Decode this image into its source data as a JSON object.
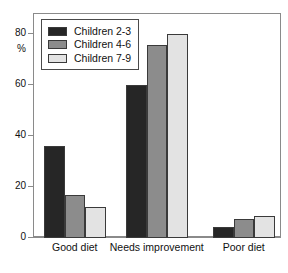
{
  "chart_data": {
    "type": "bar",
    "title": "",
    "subtitle": "",
    "xlabel": "",
    "ylabel": "%",
    "ylim": [
      0,
      88
    ],
    "yticks": [
      0,
      20,
      40,
      60,
      80
    ],
    "ytick_labels": [
      "0",
      "20",
      "40",
      "60",
      "80"
    ],
    "grid": false,
    "legend_position": "top-left",
    "categories": [
      "Good diet",
      "Needs improvement",
      "Poor diet"
    ],
    "series": [
      {
        "name": "Children 2-3",
        "color": "#262626",
        "values": [
          36,
          60,
          4.5
        ]
      },
      {
        "name": "Children 4-6",
        "color": "#8c8c8c",
        "values": [
          17,
          76,
          7.5
        ]
      },
      {
        "name": "Children 7-9",
        "color": "#e3e3e3",
        "values": [
          12,
          80,
          8.5
        ]
      }
    ]
  },
  "axis": {
    "unit_label": "%",
    "tick_0": "0",
    "tick_20": "20",
    "tick_40": "40",
    "tick_60": "60",
    "tick_80": "80"
  },
  "categories": {
    "cat_0": "Good diet",
    "cat_1": "Needs improvement",
    "cat_2": "Poor diet"
  },
  "legend": {
    "item_0": "Children 2-3",
    "item_1": "Children 4-6",
    "item_2": "Children 7-9"
  }
}
